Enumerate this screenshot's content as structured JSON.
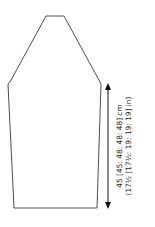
{
  "diagram": {
    "type": "knitting-schematic",
    "piece": "sleeve",
    "stroke_color": "#3a3a3a",
    "arrow_color": "#111111",
    "outline_points": [
      [
        46,
        16
      ],
      [
        64,
        16
      ],
      [
        100,
        82
      ],
      [
        101,
        84
      ],
      [
        97,
        208
      ],
      [
        14,
        208
      ],
      [
        8,
        84
      ],
      [
        10,
        82
      ]
    ],
    "measurement": {
      "line1": "45 [45: 48: 48: 48] cm",
      "line2": "(17½ [17½: 19: 19: 19] in)",
      "arrow": {
        "x": 108,
        "y_top": 84,
        "y_bottom": 208
      }
    }
  }
}
